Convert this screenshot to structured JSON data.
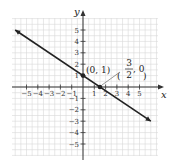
{
  "chart_data": {
    "type": "line",
    "title": "",
    "xlabel": "x",
    "ylabel": "y",
    "xlim": [
      -6,
      6
    ],
    "ylim": [
      -6,
      6
    ],
    "grid": true,
    "x_ticks": [
      -5,
      -4,
      -3,
      -2,
      -1,
      1,
      2,
      3,
      4,
      5
    ],
    "y_ticks": [
      -5,
      -4,
      -3,
      -2,
      -1,
      1,
      2,
      3,
      4,
      5
    ],
    "x_tick_labels": [
      "−5",
      "−4",
      "−3",
      "−2",
      "−1",
      "1",
      "2",
      "3",
      "4",
      "5"
    ],
    "y_tick_labels": [
      "−5",
      "−4",
      "−3",
      "−2",
      "−1",
      "1",
      "2",
      "3",
      "4",
      "5"
    ],
    "series": [
      {
        "name": "y = -2/3 x + 1",
        "x": [
          -6,
          6
        ],
        "y": [
          5,
          -3
        ],
        "arrows": "both"
      }
    ],
    "points": [
      {
        "x": 0,
        "y": 1,
        "label": "(0, 1)"
      },
      {
        "x": 1.5,
        "y": 0,
        "label_num": "3",
        "label_den": "2",
        "label_rest": ", 0"
      }
    ],
    "colors": {
      "line": "#222222",
      "grid": "#d8d8d8",
      "axis": "#333333"
    }
  }
}
